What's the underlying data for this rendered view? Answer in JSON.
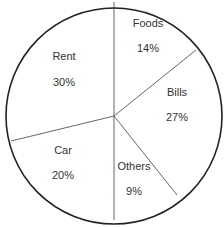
{
  "chart_data": {
    "type": "pie",
    "title": "",
    "categories": [
      "Foods",
      "Bills",
      "Others",
      "Car",
      "Rent"
    ],
    "values": [
      14,
      27,
      9,
      20,
      30
    ],
    "value_labels": [
      "14%",
      "27%",
      "9%",
      "20%",
      "30%"
    ],
    "units": "%",
    "order": "clockwise from top",
    "legend": "none (labels inside slices)",
    "colors": {
      "fill": "#ffffff",
      "border": "#222222",
      "divider": "#555555",
      "text": "#333333"
    }
  },
  "geometry": {
    "center": [
      114,
      116
    ],
    "radius": 108,
    "boundaries": [
      {
        "between": "Rent|Foods",
        "end": [
          114,
          2
        ]
      },
      {
        "between": "Foods|Bills",
        "end": [
          196,
          50
        ]
      },
      {
        "between": "Bills|Others",
        "end": [
          177,
          195
        ]
      },
      {
        "between": "Others|Car",
        "end": [
          114,
          220
        ]
      },
      {
        "between": "Car|Rent",
        "end": [
          11,
          141
        ]
      }
    ]
  },
  "labels": [
    {
      "name": "Foods",
      "pct": "14%",
      "x": 148,
      "y": 23,
      "py": 48
    },
    {
      "name": "Bills",
      "pct": "27%",
      "x": 177,
      "y": 92,
      "py": 117
    },
    {
      "name": "Others",
      "pct": "9%",
      "x": 134,
      "y": 166,
      "py": 191
    },
    {
      "name": "Car",
      "pct": "20%",
      "x": 63,
      "y": 150,
      "py": 175
    },
    {
      "name": "Rent",
      "pct": "30%",
      "x": 64,
      "y": 56,
      "py": 82
    }
  ]
}
